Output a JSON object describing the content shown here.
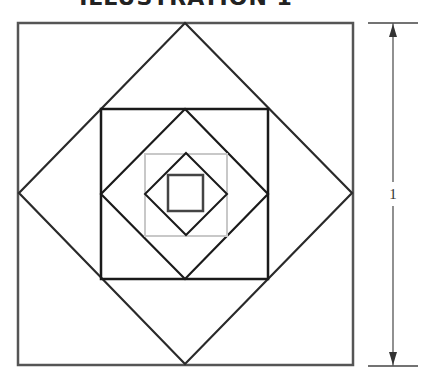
{
  "title": "ILLUSTRATION 1",
  "dimension": {
    "label": "1"
  },
  "figure": {
    "shapes": [
      {
        "type": "square",
        "name": "outer-square",
        "stroke": "#555555"
      },
      {
        "type": "diamond",
        "name": "diamond-1",
        "stroke": "#2a2a2a"
      },
      {
        "type": "square",
        "name": "square-2",
        "stroke": "#1a1a1a"
      },
      {
        "type": "diamond",
        "name": "diamond-2",
        "stroke": "#1a1a1a"
      },
      {
        "type": "square",
        "name": "square-3",
        "stroke": "#c8c8c8"
      },
      {
        "type": "diamond",
        "name": "diamond-3",
        "stroke": "#1a1a1a"
      },
      {
        "type": "square",
        "name": "square-4",
        "stroke": "#444444"
      }
    ]
  }
}
